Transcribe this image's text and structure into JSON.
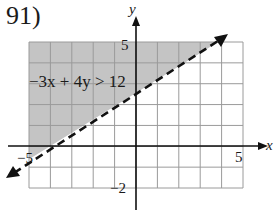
{
  "problem": {
    "number": "91)"
  },
  "chart_data": {
    "type": "line",
    "title": "",
    "inequality": "-3x + 4y > 12",
    "boundary": {
      "equation": "y = 0.75x + 3",
      "slope": 0.75,
      "intercept": 3,
      "style": "dashed",
      "points": [
        [
          -4,
          0
        ],
        [
          0,
          3
        ]
      ]
    },
    "shaded_region": "above boundary line",
    "xlabel": "x",
    "ylabel": "y",
    "xlim": [
      -5,
      5
    ],
    "ylim": [
      -2,
      5
    ],
    "tick_labels": {
      "x": [
        "-5",
        "5"
      ],
      "y": [
        "5",
        "-2"
      ]
    },
    "grid": true,
    "grid_step": 1
  },
  "labels": {
    "x_axis": "x",
    "y_axis": "y",
    "x_min": "−5",
    "x_max": "5",
    "y_max": "5",
    "y_min": "−2",
    "inequality": "−3x + 4y > 12"
  },
  "colors": {
    "grid": "#9a9a9a",
    "shade": "#c4c4c4",
    "axis": "#111111",
    "line": "#111111"
  }
}
